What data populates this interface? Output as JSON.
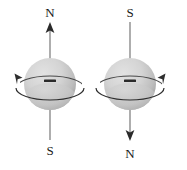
{
  "figure": {
    "background_color": "#ffffff",
    "sphere_fill_light": "#d8d8d8",
    "sphere_fill_dark": "#a8a8a8",
    "line_color": "#3a3a3a",
    "axis_color": "#6b6b6b",
    "charge_symbol": "–"
  },
  "diagrams": [
    {
      "id": "left",
      "top_label": "N",
      "bottom_label": "S",
      "charge": "–",
      "axis_arrow_direction": "up",
      "spin_direction": "counterclockwise",
      "spin_arrow_side": "left"
    },
    {
      "id": "right",
      "top_label": "S",
      "bottom_label": "N",
      "charge": "–",
      "axis_arrow_direction": "down",
      "spin_direction": "clockwise",
      "spin_arrow_side": "right"
    }
  ]
}
